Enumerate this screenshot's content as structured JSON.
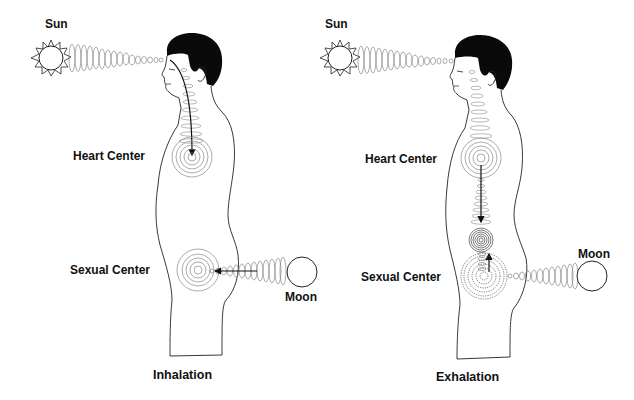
{
  "panels": [
    {
      "id": "inhalation",
      "caption": "Inhalation",
      "labels": {
        "sun": "Sun",
        "heart": "Heart Center",
        "sexual": "Sexual Center",
        "moon": "Moon"
      }
    },
    {
      "id": "exhalation",
      "caption": "Exhalation",
      "labels": {
        "sun": "Sun",
        "heart": "Heart Center",
        "sexual": "Sexual Center",
        "moon": "Moon"
      }
    }
  ],
  "colors": {
    "ink": "#111111",
    "spiral": "#777777",
    "hair": "#0a0a0a",
    "background": "#ffffff"
  }
}
